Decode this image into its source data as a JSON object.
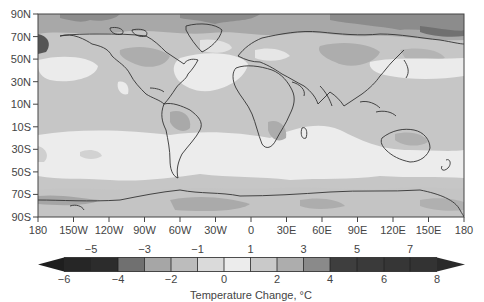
{
  "map": {
    "y_axis_labels": [
      "90N",
      "70N",
      "50N",
      "30N",
      "10N",
      "10S",
      "30S",
      "50S",
      "70S",
      "90S"
    ],
    "x_axis_labels": [
      "180",
      "150W",
      "120W",
      "90W",
      "60W",
      "30W",
      "0",
      "30E",
      "60E",
      "90E",
      "120E",
      "150E",
      "180"
    ]
  },
  "colorbar": {
    "top_labels": [
      "−5",
      "−3",
      "−1",
      "1",
      "3",
      "5",
      "7"
    ],
    "bottom_labels": [
      "−6",
      "−4",
      "−2",
      "0",
      "2",
      "4",
      "6",
      "8"
    ],
    "title": "Temperature Change, °C",
    "bins": [
      {
        "range": "<-6",
        "color": "#1e1e1e"
      },
      {
        "range": "-6 to -5",
        "color": "#262626"
      },
      {
        "range": "-5 to -4",
        "color": "#2c2c2c"
      },
      {
        "range": "-4 to -3",
        "color": "#707070"
      },
      {
        "range": "-3 to -2",
        "color": "#a6a6a6"
      },
      {
        "range": "-2 to -1",
        "color": "#bcbcbc"
      },
      {
        "range": "-1 to 0",
        "color": "#dadada"
      },
      {
        "range": "0 to 1",
        "color": "#ececec"
      },
      {
        "range": "1 to 2",
        "color": "#c9c9c9"
      },
      {
        "range": "2 to 3",
        "color": "#adadad"
      },
      {
        "range": "3 to 4",
        "color": "#8a8a8a"
      },
      {
        "range": "4 to 5",
        "color": "#3e3e3e"
      },
      {
        "range": "5 to 6",
        "color": "#3a3a3a"
      },
      {
        "range": "6 to 7",
        "color": "#363636"
      },
      {
        "range": "7 to 8",
        "color": "#333333"
      },
      {
        "range": ">8",
        "color": "#2a2a2a"
      }
    ]
  }
}
